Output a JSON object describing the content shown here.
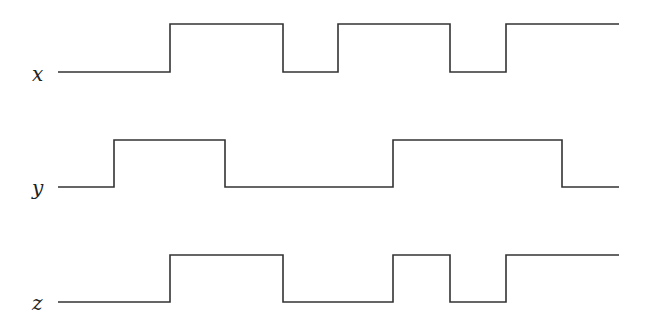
{
  "diagram": {
    "type": "timing-diagram",
    "line_color": "#333333",
    "signals": [
      {
        "name": "x",
        "label_pos": [
          32,
          64
        ],
        "low_y": 72,
        "high_y": 24,
        "points": [
          [
            58,
            0
          ],
          [
            170,
            0
          ],
          [
            170,
            1
          ],
          [
            283,
            1
          ],
          [
            283,
            0
          ],
          [
            338,
            0
          ],
          [
            338,
            1
          ],
          [
            450,
            1
          ],
          [
            450,
            0
          ],
          [
            506,
            0
          ],
          [
            506,
            1
          ],
          [
            619,
            1
          ]
        ]
      },
      {
        "name": "y",
        "label_pos": [
          32,
          178
        ],
        "low_y": 187,
        "high_y": 140,
        "points": [
          [
            58,
            0
          ],
          [
            114,
            0
          ],
          [
            114,
            1
          ],
          [
            225,
            1
          ],
          [
            225,
            0
          ],
          [
            393,
            0
          ],
          [
            393,
            1
          ],
          [
            562,
            1
          ],
          [
            562,
            0
          ],
          [
            619,
            0
          ]
        ]
      },
      {
        "name": "z",
        "label_pos": [
          32,
          293
        ],
        "low_y": 302,
        "high_y": 255,
        "points": [
          [
            58,
            0
          ],
          [
            170,
            0
          ],
          [
            170,
            1
          ],
          [
            283,
            1
          ],
          [
            283,
            0
          ],
          [
            393,
            0
          ],
          [
            393,
            1
          ],
          [
            450,
            1
          ],
          [
            450,
            0
          ],
          [
            506,
            0
          ],
          [
            506,
            1
          ],
          [
            619,
            1
          ]
        ]
      }
    ]
  }
}
